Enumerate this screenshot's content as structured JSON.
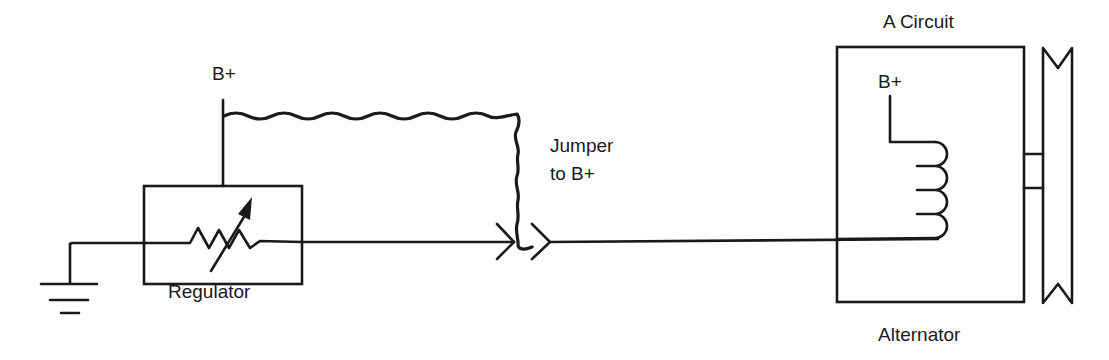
{
  "diagram": {
    "type": "circuit-schematic",
    "labels": {
      "regulator_b_plus": "B+",
      "jumper_line1": "Jumper",
      "jumper_line2": "to B+",
      "regulator": "Regulator",
      "alternator_title": "A Circuit",
      "alternator_b_plus": "B+",
      "alternator": "Alternator"
    },
    "components": [
      {
        "id": "ground",
        "symbol": "ground-icon"
      },
      {
        "id": "regulator",
        "symbol": "variable-resistor-icon",
        "label": "Regulator"
      },
      {
        "id": "jumper",
        "symbol": "jumper-wire",
        "label": "Jumper to B+"
      },
      {
        "id": "connector",
        "symbol": "connector-chevron-icon"
      },
      {
        "id": "alternator",
        "symbol": "field-coil-icon",
        "label": "Alternator",
        "circuit": "A Circuit"
      },
      {
        "id": "pulley",
        "symbol": "pulley-icon"
      }
    ],
    "colors": {
      "line": "#1a1a1a",
      "background": "#ffffff"
    }
  }
}
